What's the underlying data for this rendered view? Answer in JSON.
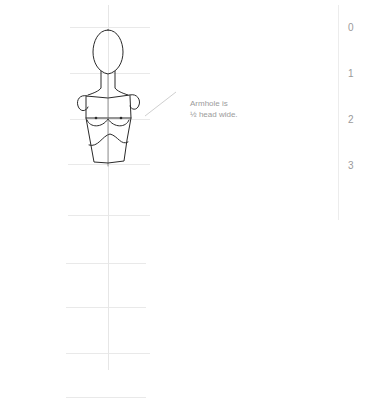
{
  "diagram": {
    "annotation": {
      "line1": "Armhole is",
      "line2": "½ head wide."
    },
    "scale": {
      "labels": [
        "0",
        "1",
        "2",
        "3"
      ]
    },
    "colors": {
      "stroke": "#2a2a2a",
      "grid": "#e9e9e9",
      "leader": "#cfcfcf",
      "label": "#9a9a9a"
    }
  }
}
